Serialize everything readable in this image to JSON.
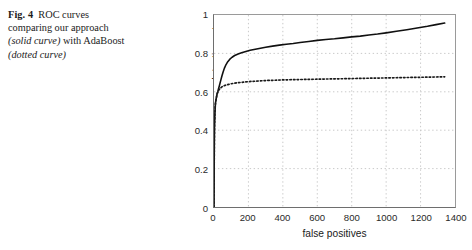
{
  "caption": {
    "figure_number": "Fig. 4",
    "line1_rest": "ROC curves",
    "line2": "comparing our approach",
    "italic1": "(solid curve)",
    "line3_mid": " with AdaBoost",
    "italic2": "(dotted curve)"
  },
  "chart_data": {
    "type": "line",
    "title": "",
    "xlabel": "false positives",
    "ylabel": "detection rate",
    "xlim": [
      0,
      1400
    ],
    "ylim": [
      0,
      1
    ],
    "xticks": [
      0,
      200,
      400,
      600,
      800,
      1000,
      1200,
      1400
    ],
    "xtick_labels": [
      "0",
      "200",
      "400",
      "600",
      "800",
      "1000",
      "1200",
      "1400"
    ],
    "yticks": [
      0,
      0.2,
      0.4,
      0.6,
      0.8,
      1
    ],
    "ytick_labels": [
      "0",
      "0.2",
      "0.4",
      "0.6",
      "0.8",
      "1"
    ],
    "grid": true,
    "grid_style": "dotted",
    "grid_color": "#c8c8c8",
    "legend": "none",
    "series": [
      {
        "name": "our approach",
        "style": "solid",
        "color": "#101010",
        "x": [
          0,
          1,
          2,
          3,
          5,
          7,
          9,
          12,
          15,
          18,
          22,
          26,
          30,
          35,
          40,
          46,
          52,
          60,
          70,
          80,
          92,
          105,
          120,
          140,
          160,
          185,
          210,
          240,
          270,
          300,
          340,
          380,
          420,
          460,
          500,
          550,
          600,
          650,
          700,
          750,
          800,
          850,
          900,
          950,
          1000,
          1060,
          1120,
          1180,
          1240,
          1290,
          1340
        ],
        "y": [
          0,
          0.2,
          0.34,
          0.42,
          0.48,
          0.52,
          0.545,
          0.56,
          0.575,
          0.59,
          0.6,
          0.615,
          0.628,
          0.645,
          0.662,
          0.682,
          0.7,
          0.722,
          0.742,
          0.757,
          0.77,
          0.78,
          0.789,
          0.797,
          0.803,
          0.81,
          0.816,
          0.822,
          0.827,
          0.832,
          0.838,
          0.843,
          0.848,
          0.852,
          0.857,
          0.862,
          0.868,
          0.872,
          0.876,
          0.881,
          0.886,
          0.89,
          0.896,
          0.901,
          0.907,
          0.915,
          0.923,
          0.932,
          0.941,
          0.95,
          0.958
        ]
      },
      {
        "name": "AdaBoost",
        "style": "dotted",
        "color": "#1a1a1a",
        "x": [
          0,
          1,
          2,
          3,
          5,
          7,
          9,
          12,
          15,
          18,
          22,
          26,
          30,
          36,
          42,
          50,
          60,
          72,
          86,
          100,
          120,
          145,
          170,
          200,
          235,
          270,
          310,
          350,
          400,
          450,
          500,
          560,
          620,
          680,
          740,
          800,
          860,
          920,
          980,
          1040,
          1100,
          1160,
          1220,
          1280,
          1340
        ],
        "y": [
          0,
          0.2,
          0.34,
          0.42,
          0.48,
          0.52,
          0.545,
          0.56,
          0.575,
          0.588,
          0.598,
          0.606,
          0.612,
          0.618,
          0.623,
          0.628,
          0.632,
          0.636,
          0.639,
          0.642,
          0.645,
          0.648,
          0.65,
          0.653,
          0.655,
          0.657,
          0.659,
          0.66,
          0.662,
          0.663,
          0.664,
          0.665,
          0.666,
          0.667,
          0.668,
          0.669,
          0.67,
          0.671,
          0.672,
          0.673,
          0.674,
          0.675,
          0.676,
          0.677,
          0.678
        ]
      }
    ]
  }
}
